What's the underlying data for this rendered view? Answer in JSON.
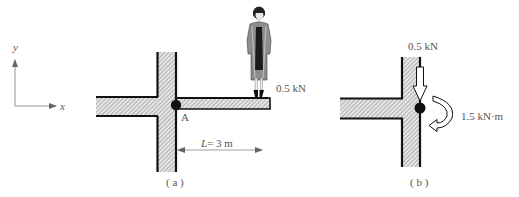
{
  "axes": {
    "x_label": "x",
    "y_label": "y"
  },
  "figure_a": {
    "caption": "( a )",
    "joint_label": "A",
    "load_label": "0.5 kN",
    "dimension_label": "L = 3 m",
    "dimension_var": "L",
    "dimension_value": "= 3 m"
  },
  "figure_b": {
    "caption": "( b )",
    "force_label": "0.5 kN",
    "moment_label": "1.5 kN·m"
  },
  "colors": {
    "ink": "#111111",
    "hatch": "#9a9a9a",
    "text": "#555555"
  }
}
